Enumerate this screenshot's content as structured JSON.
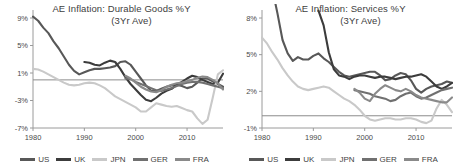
{
  "figure": {
    "width": 458,
    "height": 168,
    "background": "#ffffff"
  },
  "series_colors": {
    "US": "#585858",
    "UK": "#3c3c3c",
    "JPN": "#c9c9c9",
    "GER": "#707070",
    "FRA": "#8a8a8a"
  },
  "legend": {
    "items": [
      {
        "label": "US",
        "color": "#585858"
      },
      {
        "label": "UK",
        "color": "#3c3c3c"
      },
      {
        "label": "JPN",
        "color": "#c9c9c9"
      },
      {
        "label": "GER",
        "color": "#707070"
      },
      {
        "label": "FRA",
        "color": "#8a8a8a"
      }
    ]
  },
  "chart_data": [
    {
      "id": "durable-goods",
      "type": "line",
      "title": "AE Inflation: Durable Goods %Y",
      "subtitle": "(3Yr Ave)",
      "xlabel": "",
      "ylabel": "",
      "xlim": [
        1980,
        2017
      ],
      "ylim": [
        -7,
        9
      ],
      "yticks": [
        9,
        5,
        1,
        -3,
        -7
      ],
      "ytick_labels": [
        "9%",
        "5%",
        "1%",
        "-3%",
        "-7%"
      ],
      "xticks": [
        1980,
        1990,
        2000,
        2010
      ],
      "xtick_labels": [
        "1980",
        "1990",
        "2000",
        "2010"
      ],
      "grid": false,
      "zero_line": true,
      "legend_position": "bottom",
      "x": [
        1980,
        1981,
        1982,
        1983,
        1984,
        1985,
        1986,
        1987,
        1988,
        1989,
        1990,
        1991,
        1992,
        1993,
        1994,
        1995,
        1996,
        1997,
        1998,
        1999,
        2000,
        2001,
        2002,
        2003,
        2004,
        2005,
        2006,
        2007,
        2008,
        2009,
        2010,
        2011,
        2012,
        2013,
        2014,
        2015,
        2016,
        2017
      ],
      "series": [
        {
          "name": "US",
          "color": "#585858",
          "values": [
            9.2,
            8.6,
            7.6,
            6.8,
            5.6,
            4.6,
            3.4,
            2.2,
            1.3,
            0.8,
            1.1,
            1.4,
            1.6,
            1.6,
            1.7,
            1.8,
            2.0,
            2.6,
            2.7,
            2.2,
            1.2,
            0.2,
            -0.8,
            -1.6,
            -1.6,
            -1.3,
            -1.0,
            -0.8,
            -0.7,
            -0.9,
            -1.2,
            -1.0,
            -0.4,
            0.2,
            0.2,
            -0.2,
            -0.6,
            -1.0
          ]
        },
        {
          "name": "UK",
          "color": "#3c3c3c",
          "values": [
            null,
            null,
            null,
            null,
            null,
            null,
            null,
            null,
            null,
            null,
            2.6,
            2.5,
            2.2,
            2.1,
            2.5,
            2.8,
            2.6,
            1.6,
            0.4,
            -0.6,
            -1.4,
            -2.2,
            -2.9,
            -3.1,
            -2.6,
            -2.0,
            -1.6,
            -1.3,
            -0.7,
            -0.3,
            0.2,
            0.6,
            0.4,
            0.0,
            -0.3,
            -0.6,
            -0.4,
            0.9
          ]
        },
        {
          "name": "JPN",
          "color": "#c9c9c9",
          "values": [
            1.6,
            1.5,
            1.2,
            0.8,
            0.4,
            0.0,
            -0.4,
            -0.7,
            -0.8,
            -0.7,
            -0.5,
            -0.4,
            -0.5,
            -0.8,
            -1.2,
            -1.8,
            -2.4,
            -2.8,
            -3.2,
            -3.6,
            -4.0,
            -4.6,
            -4.6,
            -4.0,
            -3.4,
            -3.6,
            -3.8,
            -3.9,
            -3.8,
            -4.1,
            -4.4,
            -4.6,
            -5.6,
            -6.4,
            -5.8,
            -2.6,
            0.8,
            1.4
          ]
        },
        {
          "name": "GER",
          "color": "#707070",
          "values": [
            null,
            null,
            null,
            null,
            null,
            null,
            null,
            null,
            null,
            null,
            null,
            null,
            null,
            null,
            null,
            null,
            null,
            null,
            0.2,
            0.1,
            -0.3,
            -0.6,
            -0.9,
            -1.2,
            -1.5,
            -1.6,
            -1.4,
            -1.2,
            -0.9,
            -0.6,
            -0.4,
            -0.3,
            -0.3,
            -0.4,
            -0.6,
            -0.8,
            -1.0,
            -1.2
          ]
        },
        {
          "name": "FRA",
          "color": "#8a8a8a",
          "values": [
            null,
            null,
            null,
            null,
            null,
            null,
            null,
            null,
            null,
            null,
            null,
            null,
            null,
            null,
            null,
            null,
            null,
            null,
            0.6,
            0.2,
            -0.4,
            -1.0,
            -1.4,
            -1.7,
            -1.8,
            -1.5,
            -1.0,
            -0.7,
            -0.5,
            -0.4,
            -0.2,
            0.0,
            0.3,
            0.5,
            0.4,
            0.0,
            -0.5,
            -1.4
          ]
        }
      ]
    },
    {
      "id": "services",
      "type": "line",
      "title": "AE Inflation: Services  %Y",
      "subtitle": "(3Yr Ave)",
      "xlabel": "",
      "ylabel": "",
      "xlim": [
        1980,
        2017
      ],
      "ylim": [
        -1,
        8
      ],
      "yticks": [
        8,
        5,
        2,
        -1
      ],
      "ytick_labels": [
        "8%",
        "5%",
        "2%",
        "-1%"
      ],
      "xticks": [
        1980,
        1990,
        2000,
        2010
      ],
      "xtick_labels": [
        "1980",
        "1990",
        "2000",
        "2010"
      ],
      "grid": false,
      "zero_line": true,
      "legend_position": "bottom",
      "x": [
        1980,
        1981,
        1982,
        1983,
        1984,
        1985,
        1986,
        1987,
        1988,
        1989,
        1990,
        1991,
        1992,
        1993,
        1994,
        1995,
        1996,
        1997,
        1998,
        1999,
        2000,
        2001,
        2002,
        2003,
        2004,
        2005,
        2006,
        2007,
        2008,
        2009,
        2010,
        2011,
        2012,
        2013,
        2014,
        2015,
        2016,
        2017
      ],
      "series": [
        {
          "name": "US",
          "color": "#585858",
          "values": [
            null,
            null,
            10.4,
            8.4,
            6.2,
            5.1,
            4.5,
            4.8,
            4.6,
            4.6,
            4.9,
            5.1,
            4.7,
            4.4,
            4.0,
            3.6,
            3.3,
            3.2,
            3.3,
            3.4,
            3.5,
            3.6,
            3.6,
            3.3,
            2.9,
            3.0,
            3.3,
            3.5,
            3.4,
            2.9,
            2.2,
            1.9,
            2.2,
            2.4,
            2.5,
            2.6,
            2.8,
            2.7
          ]
        },
        {
          "name": "UK",
          "color": "#3c3c3c",
          "values": [
            null,
            null,
            null,
            null,
            null,
            null,
            null,
            null,
            null,
            null,
            null,
            8.6,
            7.4,
            5.2,
            3.8,
            3.3,
            3.2,
            3.0,
            3.2,
            3.3,
            3.3,
            3.2,
            3.1,
            3.2,
            3.2,
            3.1,
            3.0,
            3.1,
            3.2,
            3.2,
            3.3,
            3.4,
            3.2,
            2.8,
            2.4,
            2.2,
            2.4,
            2.7
          ]
        },
        {
          "name": "JPN",
          "color": "#c9c9c9",
          "values": [
            6.4,
            5.9,
            5.2,
            4.6,
            3.9,
            3.3,
            2.8,
            2.4,
            2.2,
            2.1,
            2.2,
            2.3,
            2.4,
            2.3,
            2.0,
            1.7,
            1.4,
            1.2,
            0.9,
            0.5,
            0.0,
            -0.3,
            -0.4,
            -0.3,
            -0.2,
            -0.2,
            -0.3,
            -0.3,
            -0.2,
            -0.2,
            -0.3,
            -0.5,
            -0.6,
            -0.4,
            0.6,
            1.3,
            0.9,
            0.3
          ]
        },
        {
          "name": "GER",
          "color": "#707070",
          "values": [
            null,
            null,
            null,
            null,
            null,
            null,
            null,
            null,
            null,
            null,
            null,
            null,
            null,
            null,
            null,
            null,
            null,
            null,
            2.1,
            2.0,
            1.9,
            1.8,
            1.6,
            1.5,
            1.4,
            1.2,
            1.3,
            1.6,
            1.8,
            1.9,
            1.6,
            1.4,
            1.5,
            1.7,
            1.9,
            2.1,
            2.2,
            2.3
          ]
        },
        {
          "name": "FRA",
          "color": "#8a8a8a",
          "values": [
            null,
            null,
            null,
            null,
            null,
            null,
            null,
            null,
            null,
            null,
            null,
            null,
            null,
            null,
            null,
            null,
            null,
            null,
            2.2,
            1.9,
            1.4,
            1.2,
            1.8,
            2.2,
            2.5,
            2.3,
            2.1,
            2.0,
            2.2,
            2.0,
            1.7,
            1.5,
            1.4,
            1.3,
            1.2,
            1.1,
            1.1,
            1.5
          ]
        }
      ]
    }
  ]
}
